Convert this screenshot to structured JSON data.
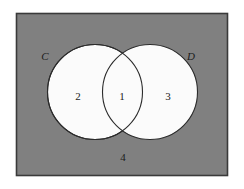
{
  "figure": {
    "type": "venn-diagram",
    "width": 244,
    "height": 189
  },
  "colors": {
    "page_background": "#ffffff",
    "universe_fill": "#808080",
    "universe_border": "#3a3a3a",
    "circle_fill": "#fbfbfb",
    "circle_stroke": "#2b2b2b",
    "text": "#1c1c1c"
  },
  "universe": {
    "name": "universal-set",
    "label": "4",
    "x": 16,
    "y": 13,
    "width": 212,
    "height": 163,
    "label_x": 123,
    "label_y": 158
  },
  "sets": [
    {
      "id": "C",
      "label": "C",
      "label_x": 45,
      "label_y": 57,
      "cx": 95,
      "cy": 92,
      "r": 47.5
    },
    {
      "id": "D",
      "label": "D",
      "label_x": 191,
      "label_y": 57,
      "cx": 150,
      "cy": 92,
      "r": 47.5
    }
  ],
  "regions": [
    {
      "id": "region-c-only",
      "label": "2",
      "description": "C only",
      "x": 78,
      "y": 97
    },
    {
      "id": "region-intersection",
      "label": "1",
      "description": "C and D",
      "x": 122,
      "y": 97
    },
    {
      "id": "region-d-only",
      "label": "3",
      "description": "D only",
      "x": 168,
      "y": 97
    },
    {
      "id": "region-outside",
      "label": "4",
      "description": "outside C and D",
      "x": 123,
      "y": 158
    }
  ]
}
